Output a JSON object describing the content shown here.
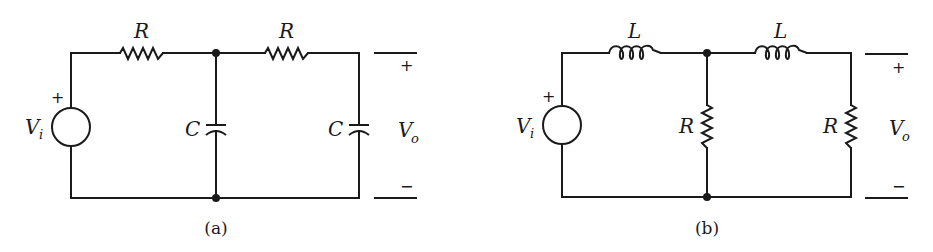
{
  "figure": {
    "colors": {
      "ink": "#1a1a1a",
      "background": "#ffffff"
    },
    "circuits": [
      {
        "caption": "(a)",
        "source": {
          "label": "V",
          "subscript": "i",
          "polarity": "+"
        },
        "series_elements": [
          {
            "type": "resistor",
            "label": "R"
          },
          {
            "type": "resistor",
            "label": "R"
          }
        ],
        "shunt_elements": [
          {
            "type": "capacitor",
            "label": "C"
          },
          {
            "type": "capacitor",
            "label": "C"
          }
        ],
        "output": {
          "label": "V",
          "subscript": "o",
          "plus": "+",
          "minus": "−"
        }
      },
      {
        "caption": "(b)",
        "source": {
          "label": "V",
          "subscript": "i",
          "polarity": "+"
        },
        "series_elements": [
          {
            "type": "inductor",
            "label": "L"
          },
          {
            "type": "inductor",
            "label": "L"
          }
        ],
        "shunt_elements": [
          {
            "type": "resistor",
            "label": "R"
          },
          {
            "type": "resistor",
            "label": "R"
          }
        ],
        "output": {
          "label": "V",
          "subscript": "o",
          "plus": "+",
          "minus": "−"
        }
      }
    ]
  }
}
